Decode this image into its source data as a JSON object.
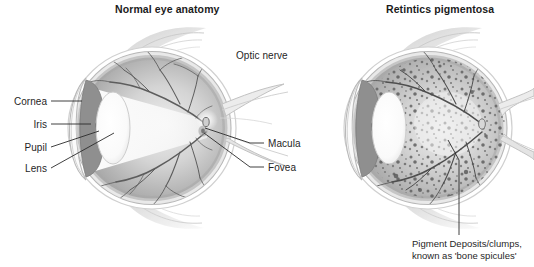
{
  "figure": {
    "kind": "medical-illustration",
    "background_color": "#ffffff",
    "ink_color": "#1f1f1f"
  },
  "panels": {
    "left": {
      "title": "Normal eye anatomy",
      "labels": {
        "cornea": "Cornea",
        "iris": "Iris",
        "pupil": "Pupil",
        "lens": "Lens",
        "optic_nerve": "Optic nerve",
        "macula": "Macula",
        "fovea": "Fovea"
      }
    },
    "right": {
      "title": "Retintics pigmentosa",
      "caption_line1": "Pigment Deposits/clumps,",
      "caption_line2": "known as 'bone spicules'"
    }
  },
  "palette": {
    "sclera_outer": "#e8e8e8",
    "sclera_ring": "#bdbdbd",
    "retina_light": "#d2d2d2",
    "retina_mid": "#b9b9b9",
    "retina_dark": "#9c9c9c",
    "iris": "#8f8f8f",
    "pupil": "#4a4a4a",
    "lens": "#fdfdfd",
    "vessel": "#5d5d5d",
    "pigment": "#5a5a5a",
    "muscle": "#d8d8d8",
    "leader_line": "#2b2b2b"
  }
}
